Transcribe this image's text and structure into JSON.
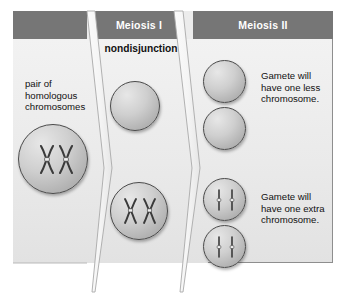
{
  "diagram": {
    "background_color": "#ffffff",
    "panel_color": "#ececec",
    "header_color": "#767676",
    "header_text_color": "#ffffff",
    "cell_outline_color": "#4a4a4a",
    "chromosome_color": "#3d3d3d"
  },
  "headers": [
    {
      "label": "",
      "name": "header-parent-cell"
    },
    {
      "label": "Meiosis I",
      "name": "header-meiosis-i"
    },
    {
      "label": "Meiosis II",
      "name": "header-meiosis-ii"
    }
  ],
  "labels": {
    "homologous": "pair of\nhomologous\nchromosomes",
    "homologous_line1": "pair of",
    "homologous_line2": "homologous",
    "homologous_line3": "chromosomes",
    "nondisjunction": "nondisjunction",
    "gamete_less": "Gamete will\nhave one less\nchromosome.",
    "gamete_less_line1": "Gamete will",
    "gamete_less_line2": "have one less",
    "gamete_less_line3": "chromosome.",
    "gamete_extra": "Gamete will\nhave one extra\nchromosome.",
    "gamete_extra_line1": "Gamete will",
    "gamete_extra_line2": "have one extra",
    "gamete_extra_line3": "chromosome."
  },
  "cells": [
    {
      "name": "parent-cell",
      "stage": "parent",
      "contents": "two replicated homologous chromosomes",
      "chromosome_count": 2,
      "chromosome_shape": "X"
    },
    {
      "name": "meiosis-i-cell-top",
      "stage": "Meiosis I",
      "contents": "empty (no chromosomes)",
      "chromosome_count": 0,
      "chromosome_shape": "none"
    },
    {
      "name": "meiosis-i-cell-bottom",
      "stage": "Meiosis I",
      "contents": "both replicated chromosomes (nondisjunction)",
      "chromosome_count": 2,
      "chromosome_shape": "X"
    },
    {
      "name": "meiosis-ii-gamete-1",
      "stage": "Meiosis II",
      "contents": "empty (no chromosomes)",
      "chromosome_count": 0,
      "chromosome_shape": "none"
    },
    {
      "name": "meiosis-ii-gamete-2",
      "stage": "Meiosis II",
      "contents": "empty (no chromosomes)",
      "chromosome_count": 0,
      "chromosome_shape": "none"
    },
    {
      "name": "meiosis-ii-gamete-3",
      "stage": "Meiosis II",
      "contents": "two single chromosomes",
      "chromosome_count": 2,
      "chromosome_shape": "rod"
    },
    {
      "name": "meiosis-ii-gamete-4",
      "stage": "Meiosis II",
      "contents": "two single chromosomes",
      "chromosome_count": 2,
      "chromosome_shape": "rod"
    }
  ]
}
